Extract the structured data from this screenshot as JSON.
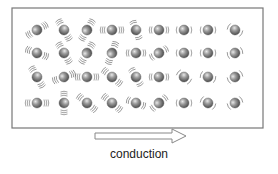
{
  "diagram": {
    "label": "conduction",
    "box": {
      "x": 12,
      "y": 8,
      "w": 251,
      "h": 120,
      "stroke": "#777777"
    },
    "arrow": {
      "x1": 95,
      "x2": 186,
      "y": 136,
      "stroke": "#888888"
    },
    "particle_color": "#8a8a8a",
    "columns_x": [
      37,
      64,
      87,
      112,
      136,
      159,
      184,
      208,
      235
    ],
    "rows_y": [
      30,
      53,
      77,
      103
    ],
    "vibration_by_column": [
      "strong",
      "strong",
      "strong",
      "strong",
      "medium",
      "medium",
      "light",
      "light",
      "light"
    ],
    "particles": [
      {
        "c": 0,
        "r": 0,
        "a": -30
      },
      {
        "c": 1,
        "r": 0,
        "a": 60
      },
      {
        "c": 2,
        "r": 0,
        "a": -60
      },
      {
        "c": 3,
        "r": 0,
        "a": 0
      },
      {
        "c": 4,
        "r": 0,
        "a": 70
      },
      {
        "c": 5,
        "r": 0,
        "a": 0
      },
      {
        "c": 6,
        "r": 0,
        "a": 0
      },
      {
        "c": 7,
        "r": 0,
        "a": 0
      },
      {
        "c": 8,
        "r": 0,
        "a": 30
      },
      {
        "c": 0,
        "r": 1,
        "a": 20
      },
      {
        "c": 1,
        "r": 1,
        "a": 60
      },
      {
        "c": 2,
        "r": 1,
        "a": -60
      },
      {
        "c": 3,
        "r": 1,
        "a": -70
      },
      {
        "c": 4,
        "r": 1,
        "a": 0
      },
      {
        "c": 5,
        "r": 1,
        "a": -30
      },
      {
        "c": 6,
        "r": 1,
        "a": 0
      },
      {
        "c": 7,
        "r": 1,
        "a": 0
      },
      {
        "c": 8,
        "r": 1,
        "a": -20
      },
      {
        "c": 0,
        "r": 2,
        "a": 60
      },
      {
        "c": 1,
        "r": 2,
        "a": -20
      },
      {
        "c": 2,
        "r": 2,
        "a": 0
      },
      {
        "c": 3,
        "r": 2,
        "a": 40
      },
      {
        "c": 4,
        "r": 2,
        "a": 60
      },
      {
        "c": 5,
        "r": 2,
        "a": 0
      },
      {
        "c": 6,
        "r": 2,
        "a": 40
      },
      {
        "c": 7,
        "r": 2,
        "a": 20
      },
      {
        "c": 8,
        "r": 2,
        "a": -30
      },
      {
        "c": 0,
        "r": 3,
        "a": 0
      },
      {
        "c": 1,
        "r": 3,
        "a": 90
      },
      {
        "c": 2,
        "r": 3,
        "a": 40
      },
      {
        "c": 3,
        "r": 3,
        "a": 40
      },
      {
        "c": 4,
        "r": 3,
        "a": 20
      },
      {
        "c": 5,
        "r": 3,
        "a": -40
      },
      {
        "c": 6,
        "r": 3,
        "a": 0
      },
      {
        "c": 7,
        "r": 3,
        "a": 30
      },
      {
        "c": 8,
        "r": 3,
        "a": -30
      }
    ]
  }
}
